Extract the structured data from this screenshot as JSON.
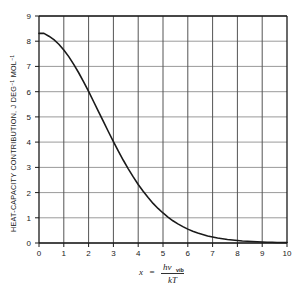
{
  "chart_data": {
    "type": "line",
    "title": "",
    "subtitle": "",
    "xlabel": "x = hν_vib / kT",
    "ylabel": "HEAT-CAPACITY CONTRIBUTION, J DEG⁻¹ MOL⁻¹",
    "xlim": [
      0,
      10
    ],
    "ylim": [
      0,
      9
    ],
    "grid": true,
    "legend": null,
    "legend_position": "none",
    "x_ticks": [
      0,
      1,
      2,
      3,
      4,
      5,
      6,
      7,
      8,
      9,
      10
    ],
    "y_ticks": [
      0,
      1,
      2,
      3,
      4,
      5,
      6,
      7,
      8,
      9
    ],
    "x_tick_labels": [
      "0",
      "1",
      "2",
      "3",
      "4",
      "5",
      "6",
      "7",
      "8",
      "9",
      "10"
    ],
    "y_tick_labels": [
      "0",
      "1",
      "2",
      "3",
      "4",
      "5",
      "6",
      "7",
      "8",
      "9"
    ],
    "series": [
      {
        "name": "Einstein vibrational heat capacity",
        "color": "#1a1a1a",
        "x": [
          0.0,
          0.2,
          0.4,
          0.6,
          0.8,
          1.0,
          1.2,
          1.4,
          1.6,
          1.8,
          2.0,
          2.2,
          2.4,
          2.6,
          2.8,
          3.0,
          3.2,
          3.4,
          3.6,
          3.8,
          4.0,
          4.2,
          4.4,
          4.6,
          4.8,
          5.0,
          5.2,
          5.4,
          5.6,
          5.8,
          6.0,
          6.2,
          6.4,
          6.6,
          6.8,
          7.0,
          7.2,
          7.4,
          7.6,
          7.8,
          8.0,
          8.2,
          8.4,
          8.6,
          8.8,
          9.0,
          9.2,
          9.4,
          9.6,
          9.8,
          10.0
        ],
        "y": [
          8.31,
          8.31,
          8.2,
          8.06,
          7.88,
          7.65,
          7.39,
          7.08,
          6.75,
          6.39,
          6.01,
          5.61,
          5.21,
          4.81,
          4.41,
          4.02,
          3.64,
          3.28,
          2.94,
          2.62,
          2.32,
          2.05,
          1.8,
          1.57,
          1.37,
          1.19,
          1.03,
          0.88,
          0.76,
          0.65,
          0.55,
          0.47,
          0.4,
          0.34,
          0.28,
          0.24,
          0.2,
          0.17,
          0.14,
          0.12,
          0.1,
          0.08,
          0.07,
          0.06,
          0.05,
          0.04,
          0.03,
          0.03,
          0.02,
          0.02,
          0.02
        ]
      }
    ],
    "notable_values": {
      "value_at_x0": 8.31,
      "value_at_x1": 7.65,
      "value_at_x2": 6.01,
      "value_at_x3": 4.02,
      "value_at_x4": 2.32,
      "value_at_x5": 1.19,
      "value_at_x6": 0.55,
      "value_at_x7": 0.24,
      "value_at_x8": 0.1,
      "value_at_x9": 0.04,
      "value_at_x10": 0.02
    }
  },
  "axes": {
    "y_axis_title": "HEAT-CAPACITY CONTRIBUTION, J DEG",
    "y_axis_title_sup1": "−1",
    "y_axis_title_mid": " MOL",
    "y_axis_title_sup2": "−1",
    "x_formula": {
      "variable": "x",
      "equals": "=",
      "numerator_main": "hν",
      "numerator_sub": "vib",
      "denominator": "kT"
    }
  },
  "colors": {
    "background": "#ffffff",
    "curve": "#1a1a1a",
    "frame": "#1a1a1a",
    "gridline_vertical": "#545454",
    "gridline_horizontal": "#9a9a9a",
    "text": "#1a1a1a"
  }
}
